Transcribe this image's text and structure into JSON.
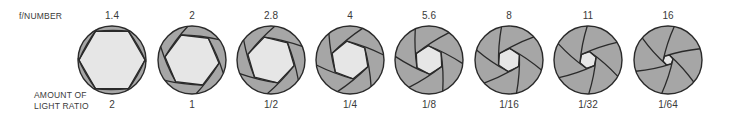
{
  "labels": {
    "f_number": "f/NUMBER",
    "amount_line1": "AMOUNT OF",
    "amount_line2": "LIGHT RATIO"
  },
  "colors": {
    "blade": "#a6a6a6",
    "opening": "#e6e6e6",
    "outline": "#2a2a2a",
    "text": "#3a3a3a"
  },
  "apertures": [
    {
      "f": "1.4",
      "ratio": "2",
      "cx": 112,
      "open": 0.97
    },
    {
      "f": "2",
      "ratio": "1",
      "cx": 192,
      "open": 0.8
    },
    {
      "f": "2.8",
      "ratio": "1/2",
      "cx": 271,
      "open": 0.7
    },
    {
      "f": "4",
      "ratio": "1/4",
      "cx": 350,
      "open": 0.56
    },
    {
      "f": "5.6",
      "ratio": "1/8",
      "cx": 429,
      "open": 0.42
    },
    {
      "f": "8",
      "ratio": "1/16",
      "cx": 509,
      "open": 0.34
    },
    {
      "f": "11",
      "ratio": "1/32",
      "cx": 588,
      "open": 0.25
    },
    {
      "f": "16",
      "ratio": "1/64",
      "cx": 668,
      "open": 0.15
    }
  ],
  "chart_data": {
    "type": "table",
    "columns": [
      "f/NUMBER",
      "AMOUNT OF LIGHT RATIO"
    ],
    "rows": [
      [
        "1.4",
        "2"
      ],
      [
        "2",
        "1"
      ],
      [
        "2.8",
        "1/2"
      ],
      [
        "4",
        "1/4"
      ],
      [
        "5.6",
        "1/8"
      ],
      [
        "8",
        "1/16"
      ],
      [
        "11",
        "1/32"
      ],
      [
        "16",
        "1/64"
      ]
    ]
  }
}
